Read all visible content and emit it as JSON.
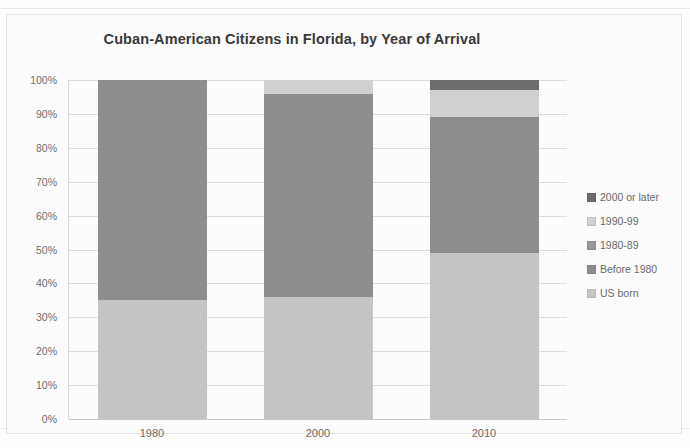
{
  "chart_data": {
    "type": "bar",
    "subtype": "stacked-percentage",
    "title": "Cuban-American Citizens in Florida, by Year of Arrival",
    "xlabel": "",
    "ylabel": "",
    "ylim": [
      0,
      100
    ],
    "grid": true,
    "legend_position": "right",
    "categories": [
      "1980",
      "2000",
      "2010"
    ],
    "ytick_labels": [
      "100%",
      "90%",
      "80%",
      "70%",
      "60%",
      "50%",
      "40%",
      "30%",
      "20%",
      "10%",
      "0%"
    ],
    "ytick_values": [
      100,
      90,
      80,
      70,
      60,
      50,
      40,
      30,
      20,
      10,
      0
    ],
    "series": [
      {
        "name": "US born",
        "color": "#c6c6c6",
        "values": [
          35,
          36,
          49
        ]
      },
      {
        "name": "Before 1980",
        "color": "#8f8f8f",
        "values": [
          65,
          60,
          40
        ]
      },
      {
        "name": "1980-89",
        "color": "#a0a0a0",
        "values": [
          0,
          0,
          0
        ]
      },
      {
        "name": "1990-99",
        "color": "#d2d2d2",
        "values": [
          0,
          4,
          8
        ]
      },
      {
        "name": "2000 or later",
        "color": "#6d6d6d",
        "values": [
          0,
          0,
          3
        ]
      }
    ],
    "legend_entries": [
      {
        "label": "2000 or later",
        "color": "#6d6d6d"
      },
      {
        "label": "1990-99",
        "color": "#d2d2d2"
      },
      {
        "label": "1980-89",
        "color": "#9a9a9a"
      },
      {
        "label": "Before 1980",
        "color": "#8f8f8f"
      },
      {
        "label": "US born",
        "color": "#c8c8c8"
      }
    ],
    "stack_order_bottom_to_top": [
      "US born",
      "Before 1980",
      "1980-89",
      "1990-99",
      "2000 or later"
    ]
  }
}
